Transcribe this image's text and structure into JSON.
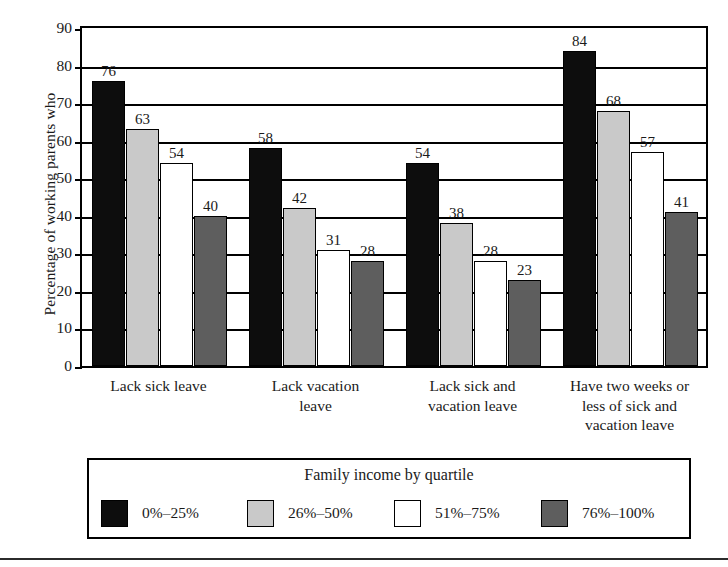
{
  "chart_data": {
    "type": "bar",
    "title": "",
    "xlabel": "",
    "ylabel": "Percentage of working parents who",
    "ylim": [
      0,
      90
    ],
    "ytick_step": 10,
    "yticks": [
      "0",
      "10",
      "20",
      "30",
      "40",
      "50",
      "60",
      "70",
      "80",
      "90"
    ],
    "grid": true,
    "legend_position": "bottom",
    "legend_title": "Family income by quartile",
    "categories": [
      "Lack sick leave",
      "Lack vacation leave",
      "Lack sick and vacation leave",
      "Have two weeks or less of sick and vacation leave"
    ],
    "series": [
      {
        "name": "0%–25%",
        "color": "#0d0d0d",
        "values": [
          76,
          58,
          54,
          84
        ]
      },
      {
        "name": "26%–50%",
        "color": "#c9c9c9",
        "values": [
          63,
          42,
          38,
          68
        ]
      },
      {
        "name": "51%–75%",
        "color": "#ffffff",
        "values": [
          54,
          31,
          28,
          57
        ]
      },
      {
        "name": "76%–100%",
        "color": "#5e5e5e",
        "values": [
          40,
          28,
          23,
          41
        ]
      }
    ]
  },
  "axis": {
    "y_title": "Percentage of working parents who"
  },
  "category_labels": [
    [
      "Lack sick leave"
    ],
    [
      "Lack vacation",
      "leave"
    ],
    [
      "Lack sick and",
      "vacation leave"
    ],
    [
      "Have two weeks or",
      "less of sick and",
      "vacation leave"
    ]
  ],
  "legend": {
    "title": "Family income by quartile",
    "items": [
      {
        "label": "0%–25%",
        "swatch": "swatch-q1"
      },
      {
        "label": "26%–50%",
        "swatch": "swatch-q2"
      },
      {
        "label": "51%–75%",
        "swatch": "swatch-q3"
      },
      {
        "label": "76%–100%",
        "swatch": "swatch-q4"
      }
    ]
  }
}
